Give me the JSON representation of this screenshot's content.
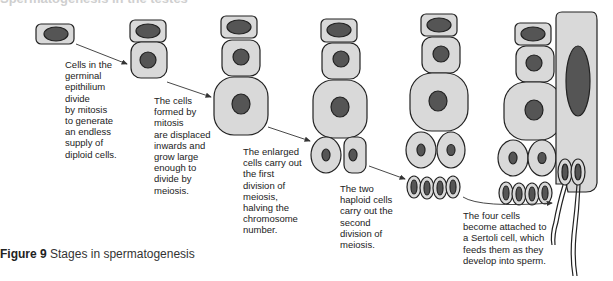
{
  "heading_partial": "Spermatogenesis in the testes",
  "labels": [
    {
      "text": "Cells in the\ngerminal\nepithilium\ndivide\nby mitosis\nto generate\nan endless\nsupply of\ndiploid cells."
    },
    {
      "text": "The cells\nformed by\nmitosis\nare displaced\ninwards and\ngrow large\nenough to\ndivide by\nmeiosis."
    },
    {
      "text": "The enlarged\ncells carry out\nthe first\ndivision of\nmeiosis,\nhalving the\nchromosome\nnumber."
    },
    {
      "text": "The two\nhaploid cells\ncarry out the\nsecond\ndivision of\nmeiosis."
    },
    {
      "text": "The four cells\nbecome attached to\na Sertoli cell, which\nfeeds them as they\ndevelop into sperm."
    }
  ],
  "caption": {
    "prefix": "Figure 9",
    "text": "Stages in spermatogenesis"
  },
  "colors": {
    "cytoplasm": "#d9d9d9",
    "nucleus": "#555555",
    "outline": "#222222",
    "arrow": "#333333"
  }
}
